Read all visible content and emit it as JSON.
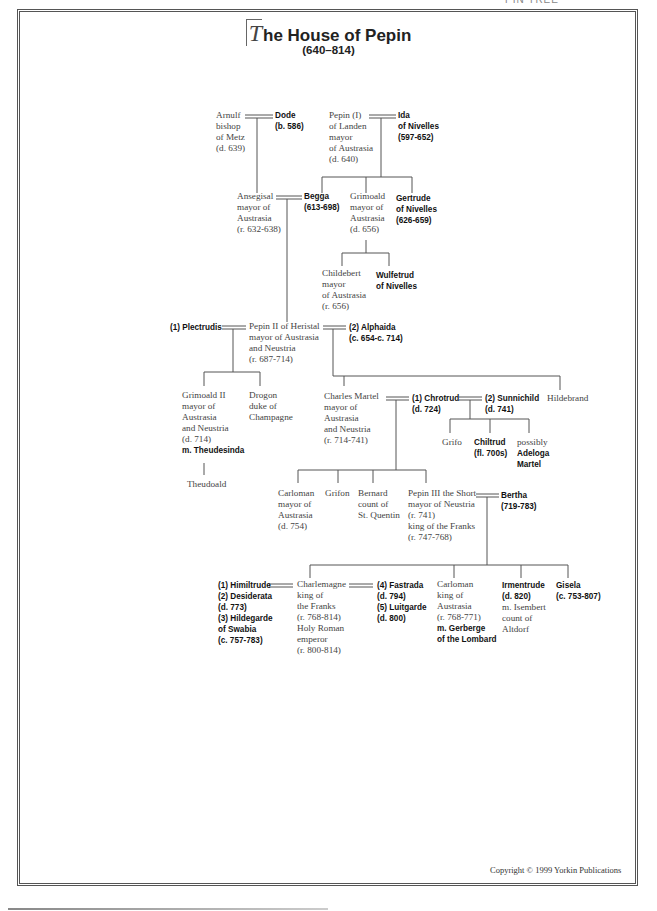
{
  "page": {
    "header_cut": "PIN TREE",
    "title_initial": "T",
    "title_rest": "he House of Pepin",
    "subtitle": "(640–814)",
    "copyright": "Copyright © 1999 Yorkin Publications"
  },
  "people": {
    "arnulf": [
      "Arnulf",
      "bishop",
      "of Metz",
      "(d. 639)"
    ],
    "dode": [
      "Dode",
      "(b. 586)"
    ],
    "pepin1": [
      "Pepin (I)",
      "of Landen",
      "mayor",
      "of Austrasia",
      "(d. 640)"
    ],
    "ida": [
      "Ida",
      "of Nivelles",
      "(597-652)"
    ],
    "ansegisal": [
      "Ansegisal",
      "mayor of",
      "Austrasia",
      "(r. 632-638)"
    ],
    "begga": [
      "Begga",
      "(613-698)"
    ],
    "grimoald": [
      "Grimoald",
      "mayor of",
      "Austrasia",
      "(d. 656)"
    ],
    "gertrude": [
      "Gertrude",
      "of Nivelles",
      "(626-659)"
    ],
    "childebert": [
      "Childebert",
      "mayor",
      "of Austrasia",
      "(r. 656)"
    ],
    "wulfetrud": [
      "Wulfetrud",
      "of Nivelles"
    ],
    "plectrudis": [
      "(1) Plectrudis"
    ],
    "pepin2": [
      "Pepin II of Heristal",
      "mayor of Austrasia",
      "and Neustria",
      "(r. 687-714)"
    ],
    "alphaida": [
      "(2) Alphaida",
      "(c. 654-c. 714)"
    ],
    "grimoald2": [
      "Grimoald II",
      "mayor of",
      "Austrasia",
      "and Neustria",
      "(d. 714)"
    ],
    "grimoald2_spouse": "m. Theudesinda",
    "drogon": [
      "Drogon",
      "duke of",
      "Champagne"
    ],
    "charles": [
      "Charles Martel",
      "mayor of",
      "Austrasia",
      "and Neustria",
      "(r. 714-741)"
    ],
    "chrotrud": [
      "(1) Chrotrud",
      "(d. 724)"
    ],
    "sunnichild": [
      "(2) Sunnichild",
      "(d. 741)"
    ],
    "hildebrand": [
      "Hildebrand"
    ],
    "theudoald": [
      "Theudoald"
    ],
    "grifo": [
      "Grifo"
    ],
    "chiltrud": [
      "Chiltrud",
      "(fl. 700s)"
    ],
    "adeloga_prefix": "possibly",
    "adeloga": [
      "Adeloga",
      "Martel"
    ],
    "carloman1": [
      "Carloman",
      "mayor of",
      "Austrasia",
      "(d. 754)"
    ],
    "grifon": [
      "Grifon"
    ],
    "bernard": [
      "Bernard",
      "count of",
      "St. Quentin"
    ],
    "pepin3": [
      "Pepin III the Short",
      "mayor of Neustria",
      "(r. 741)",
      "king of the Franks",
      "(r. 747-768)"
    ],
    "bertha": [
      "Bertha",
      "(719-783)"
    ],
    "wives1": [
      "(1) Himiltrude",
      "(2) Desiderata",
      "(d. 773)",
      "(3) Hildegarde",
      "of Swabia",
      "(c. 757-783)"
    ],
    "charlemagne": [
      "Charlemagne",
      "king of",
      "the Franks",
      "(r. 768-814)",
      "Holy Roman",
      "emperor",
      "(r. 800-814)"
    ],
    "wives2": [
      "(4) Fastrada",
      "(d. 794)",
      "(5) Luitgarde",
      "(d. 800)"
    ],
    "carloman2": [
      "Carloman",
      "king of",
      "Austrasia",
      "(r. 768-771)"
    ],
    "carloman2_spouse": [
      "m. Gerberge",
      "of the Lombard"
    ],
    "irmentrude": [
      "Irmentrude",
      "(d. 820)"
    ],
    "irmentrude_spouse": [
      "m. Isembert",
      "count of",
      "Altdorf"
    ],
    "gisela": [
      "Gisela",
      "(c. 753-807)"
    ]
  }
}
